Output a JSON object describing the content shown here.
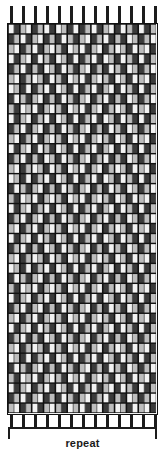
{
  "figure": {
    "kind": "weaving-draft-threading-grid",
    "repeat_label": "repeat"
  },
  "colors": {
    "ink": "#1c1c1c",
    "grid_line": "#111111",
    "cell_empty": "#f2f2f2",
    "cell_light": "#bdbdbd",
    "cell_mid": "#8a8a8a",
    "cell_dark": "#3a3a3a",
    "background": "#ffffff"
  },
  "grid": {
    "x": 7,
    "y": 23,
    "width": 151,
    "height": 392,
    "columns": 25,
    "rows": 39,
    "cell_width": 6,
    "cell_height": 10,
    "major_column_every": 2,
    "major_row_every": 1
  },
  "top_ticks": {
    "count": 13,
    "start_x": 10,
    "spacing": 12,
    "width": 3,
    "height": 17
  },
  "bottom_ticks": {
    "count": 13,
    "start_x": 10,
    "spacing": 12,
    "width": 3,
    "height": 14
  },
  "repeat_bracket": {
    "x": 8,
    "y": 427,
    "width": 149,
    "height": 12
  },
  "chart_data": {
    "type": "heatmap",
    "title": "",
    "xlabel": "",
    "ylabel": "",
    "note": "Dense monochrome weaving/threading draft. Each row is a pick; each column is a warp end. Cell shade encodes the float length: 0 = empty (light), 1 = light grey, 2 = mid grey, 3 = dark.",
    "legend": [
      "empty",
      "light",
      "mid",
      "dark"
    ],
    "columns": 25,
    "rows": 39,
    "values": [
      [
        0,
        3,
        1,
        0,
        3,
        1,
        0,
        3,
        0,
        1,
        3,
        0,
        3,
        1,
        0,
        3,
        1,
        0,
        3,
        0,
        1,
        3,
        0,
        3,
        1
      ],
      [
        3,
        1,
        0,
        3,
        1,
        0,
        3,
        1,
        3,
        0,
        1,
        3,
        1,
        0,
        3,
        1,
        0,
        3,
        1,
        3,
        0,
        1,
        3,
        1,
        0
      ],
      [
        1,
        0,
        3,
        1,
        0,
        3,
        1,
        0,
        1,
        3,
        0,
        1,
        0,
        3,
        1,
        0,
        3,
        1,
        0,
        1,
        3,
        0,
        1,
        0,
        3
      ],
      [
        0,
        3,
        1,
        0,
        3,
        0,
        1,
        3,
        0,
        1,
        3,
        0,
        3,
        1,
        0,
        3,
        0,
        1,
        3,
        0,
        1,
        3,
        0,
        3,
        1
      ],
      [
        3,
        1,
        0,
        3,
        1,
        3,
        0,
        1,
        3,
        0,
        1,
        3,
        1,
        0,
        3,
        1,
        3,
        0,
        1,
        3,
        0,
        1,
        3,
        1,
        0
      ],
      [
        1,
        0,
        3,
        1,
        0,
        1,
        3,
        0,
        1,
        3,
        0,
        1,
        0,
        3,
        1,
        0,
        1,
        3,
        0,
        1,
        3,
        0,
        1,
        0,
        3
      ],
      [
        0,
        1,
        3,
        0,
        3,
        1,
        0,
        3,
        0,
        1,
        3,
        0,
        3,
        1,
        0,
        3,
        1,
        0,
        3,
        0,
        1,
        3,
        0,
        3,
        1
      ],
      [
        3,
        0,
        1,
        3,
        1,
        0,
        3,
        1,
        3,
        0,
        1,
        3,
        1,
        0,
        3,
        1,
        0,
        3,
        1,
        3,
        0,
        1,
        3,
        1,
        0
      ],
      [
        1,
        3,
        0,
        1,
        0,
        3,
        1,
        0,
        1,
        3,
        0,
        1,
        0,
        3,
        1,
        0,
        3,
        1,
        0,
        1,
        3,
        0,
        1,
        0,
        3
      ],
      [
        0,
        3,
        1,
        0,
        3,
        1,
        0,
        3,
        0,
        1,
        3,
        0,
        3,
        1,
        0,
        3,
        0,
        1,
        3,
        0,
        1,
        3,
        0,
        3,
        1
      ],
      [
        3,
        1,
        0,
        3,
        1,
        0,
        3,
        1,
        3,
        0,
        1,
        3,
        1,
        0,
        3,
        1,
        3,
        0,
        1,
        3,
        0,
        1,
        3,
        1,
        0
      ],
      [
        1,
        0,
        3,
        1,
        0,
        3,
        1,
        0,
        1,
        3,
        0,
        1,
        0,
        3,
        1,
        0,
        1,
        3,
        0,
        1,
        3,
        0,
        1,
        0,
        3
      ],
      [
        0,
        3,
        1,
        0,
        3,
        0,
        1,
        3,
        0,
        1,
        3,
        0,
        3,
        1,
        0,
        3,
        1,
        0,
        3,
        0,
        1,
        3,
        0,
        3,
        1
      ],
      [
        3,
        1,
        0,
        3,
        1,
        3,
        0,
        1,
        3,
        0,
        1,
        3,
        1,
        0,
        3,
        1,
        0,
        3,
        1,
        3,
        0,
        1,
        3,
        1,
        0
      ],
      [
        1,
        0,
        3,
        1,
        0,
        1,
        3,
        0,
        1,
        3,
        0,
        1,
        0,
        3,
        1,
        0,
        3,
        1,
        0,
        1,
        3,
        0,
        1,
        0,
        3
      ],
      [
        0,
        1,
        3,
        0,
        3,
        1,
        0,
        3,
        0,
        1,
        3,
        0,
        3,
        1,
        0,
        3,
        0,
        1,
        3,
        0,
        1,
        3,
        0,
        3,
        1
      ],
      [
        3,
        0,
        1,
        3,
        1,
        0,
        3,
        1,
        3,
        0,
        1,
        3,
        1,
        0,
        3,
        1,
        3,
        0,
        1,
        3,
        0,
        1,
        3,
        1,
        0
      ],
      [
        1,
        3,
        0,
        1,
        0,
        3,
        1,
        0,
        1,
        3,
        0,
        1,
        0,
        3,
        1,
        0,
        1,
        3,
        0,
        1,
        3,
        0,
        1,
        0,
        3
      ],
      [
        0,
        3,
        1,
        0,
        3,
        1,
        0,
        3,
        0,
        1,
        3,
        0,
        3,
        1,
        0,
        3,
        1,
        0,
        3,
        0,
        1,
        3,
        0,
        3,
        1
      ],
      [
        3,
        1,
        0,
        3,
        1,
        0,
        3,
        1,
        3,
        0,
        1,
        3,
        1,
        0,
        3,
        1,
        0,
        3,
        1,
        3,
        0,
        1,
        3,
        1,
        0
      ],
      [
        1,
        0,
        3,
        1,
        0,
        3,
        1,
        0,
        1,
        3,
        0,
        1,
        0,
        3,
        1,
        0,
        3,
        1,
        0,
        1,
        3,
        0,
        1,
        0,
        3
      ],
      [
        0,
        3,
        1,
        0,
        3,
        0,
        1,
        3,
        0,
        1,
        3,
        0,
        3,
        1,
        0,
        3,
        0,
        1,
        3,
        0,
        1,
        3,
        0,
        3,
        1
      ],
      [
        3,
        1,
        0,
        3,
        1,
        3,
        0,
        1,
        3,
        0,
        1,
        3,
        1,
        0,
        3,
        1,
        3,
        0,
        1,
        3,
        0,
        1,
        3,
        1,
        0
      ],
      [
        1,
        0,
        3,
        1,
        0,
        1,
        3,
        0,
        1,
        3,
        0,
        1,
        0,
        3,
        1,
        0,
        1,
        3,
        0,
        1,
        3,
        0,
        1,
        0,
        3
      ],
      [
        0,
        1,
        3,
        0,
        3,
        1,
        0,
        3,
        0,
        1,
        3,
        0,
        3,
        1,
        0,
        3,
        1,
        0,
        3,
        0,
        1,
        3,
        0,
        3,
        1
      ],
      [
        3,
        0,
        1,
        3,
        1,
        0,
        3,
        1,
        3,
        0,
        1,
        3,
        1,
        0,
        3,
        1,
        0,
        3,
        1,
        3,
        0,
        1,
        3,
        1,
        0
      ],
      [
        1,
        3,
        0,
        1,
        0,
        3,
        1,
        0,
        1,
        3,
        0,
        1,
        0,
        3,
        1,
        0,
        3,
        1,
        0,
        1,
        3,
        0,
        1,
        0,
        3
      ],
      [
        0,
        3,
        1,
        0,
        3,
        1,
        0,
        3,
        0,
        1,
        3,
        0,
        3,
        1,
        0,
        3,
        0,
        1,
        3,
        0,
        1,
        3,
        0,
        3,
        1
      ],
      [
        3,
        1,
        0,
        3,
        1,
        0,
        3,
        1,
        3,
        0,
        1,
        3,
        1,
        0,
        3,
        1,
        3,
        0,
        1,
        3,
        0,
        1,
        3,
        1,
        0
      ],
      [
        1,
        0,
        3,
        1,
        0,
        3,
        1,
        0,
        1,
        3,
        0,
        1,
        0,
        3,
        1,
        0,
        1,
        3,
        0,
        1,
        3,
        0,
        1,
        0,
        3
      ],
      [
        0,
        3,
        1,
        0,
        3,
        0,
        1,
        3,
        0,
        1,
        3,
        0,
        3,
        1,
        0,
        3,
        1,
        0,
        3,
        0,
        1,
        3,
        0,
        3,
        1
      ],
      [
        3,
        1,
        0,
        3,
        1,
        3,
        0,
        1,
        3,
        0,
        1,
        3,
        1,
        0,
        3,
        1,
        0,
        3,
        1,
        3,
        0,
        1,
        3,
        1,
        0
      ],
      [
        1,
        0,
        3,
        1,
        0,
        1,
        3,
        0,
        1,
        3,
        0,
        1,
        0,
        3,
        1,
        0,
        3,
        1,
        0,
        1,
        3,
        0,
        1,
        0,
        3
      ],
      [
        0,
        1,
        3,
        0,
        3,
        1,
        0,
        3,
        0,
        1,
        3,
        0,
        3,
        1,
        0,
        3,
        0,
        1,
        3,
        0,
        1,
        3,
        0,
        3,
        1
      ],
      [
        3,
        0,
        1,
        3,
        1,
        0,
        3,
        1,
        3,
        0,
        1,
        3,
        1,
        0,
        3,
        1,
        3,
        0,
        1,
        3,
        0,
        1,
        3,
        1,
        0
      ],
      [
        1,
        3,
        0,
        1,
        0,
        3,
        1,
        0,
        1,
        3,
        0,
        1,
        0,
        3,
        1,
        0,
        1,
        3,
        0,
        1,
        3,
        0,
        1,
        0,
        3
      ],
      [
        0,
        3,
        1,
        0,
        3,
        1,
        0,
        3,
        0,
        1,
        3,
        0,
        3,
        1,
        0,
        3,
        1,
        0,
        3,
        0,
        1,
        3,
        0,
        3,
        1
      ],
      [
        3,
        1,
        0,
        3,
        1,
        0,
        3,
        1,
        3,
        0,
        1,
        3,
        1,
        0,
        3,
        1,
        0,
        3,
        1,
        3,
        0,
        1,
        3,
        1,
        0
      ],
      [
        1,
        0,
        3,
        1,
        0,
        3,
        1,
        0,
        1,
        3,
        0,
        1,
        0,
        3,
        1,
        0,
        3,
        1,
        0,
        1,
        3,
        0,
        1,
        0,
        3
      ]
    ]
  }
}
